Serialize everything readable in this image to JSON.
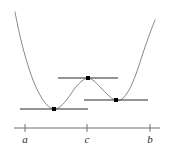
{
  "figure": {
    "background_color": "#ffffff",
    "curve_color": "#7a7a7a",
    "tangent_color": "#2b2b2b",
    "axis_color": "#6e6e6e",
    "point_color": "#000000",
    "label_color": "#2b2b2b"
  },
  "chart_data": {
    "type": "line",
    "title": "",
    "xlabel": "",
    "ylabel": "",
    "grid": false,
    "legend": null,
    "xlim": [
      0,
      169
    ],
    "ylim": [
      149,
      0
    ],
    "curve_description": "Smooth W-shaped quartic-like curve: steep descent from upper left, local minimum, rise to local maximum near c, descent to a second local minimum, steep ascent to upper right",
    "curve_points": [
      [
        15,
        12
      ],
      [
        20,
        36
      ],
      [
        26,
        59
      ],
      [
        33,
        80
      ],
      [
        40,
        95
      ],
      [
        47,
        105
      ],
      [
        54,
        109
      ],
      [
        61,
        106
      ],
      [
        68,
        98
      ],
      [
        75,
        88
      ],
      [
        82,
        81
      ],
      [
        88,
        78
      ],
      [
        94,
        81
      ],
      [
        101,
        88
      ],
      [
        108,
        95
      ],
      [
        115,
        100
      ],
      [
        122,
        99
      ],
      [
        129,
        90
      ],
      [
        136,
        74
      ],
      [
        143,
        53
      ],
      [
        150,
        33
      ],
      [
        155,
        20
      ]
    ],
    "critical_points": [
      {
        "name": "left-local-minimum",
        "x": 54,
        "y": 109,
        "kind": "minimum"
      },
      {
        "name": "local-maximum",
        "x": 88,
        "y": 78,
        "kind": "maximum"
      },
      {
        "name": "right-local-minimum",
        "x": 116,
        "y": 100,
        "kind": "minimum"
      }
    ],
    "tangent_lines": [
      {
        "name": "tangent-at-left-minimum",
        "x1": 20,
        "x2": 88,
        "y": 109,
        "slope": 0
      },
      {
        "name": "tangent-at-local-maximum",
        "x1": 58,
        "x2": 118,
        "y": 78,
        "slope": 0
      },
      {
        "name": "tangent-at-right-minimum",
        "x1": 84,
        "x2": 148,
        "y": 100,
        "slope": 0
      }
    ],
    "axis": {
      "y": 128,
      "x_start": 14,
      "x_end": 160,
      "tick_half_height": 4
    },
    "ticks": [
      {
        "label": "a",
        "x": 25,
        "label_x": 25,
        "label_y": 143
      },
      {
        "label": "c",
        "x": 87,
        "label_x": 87,
        "label_y": 143
      },
      {
        "label": "b",
        "x": 150,
        "label_x": 150,
        "label_y": 143
      }
    ]
  }
}
